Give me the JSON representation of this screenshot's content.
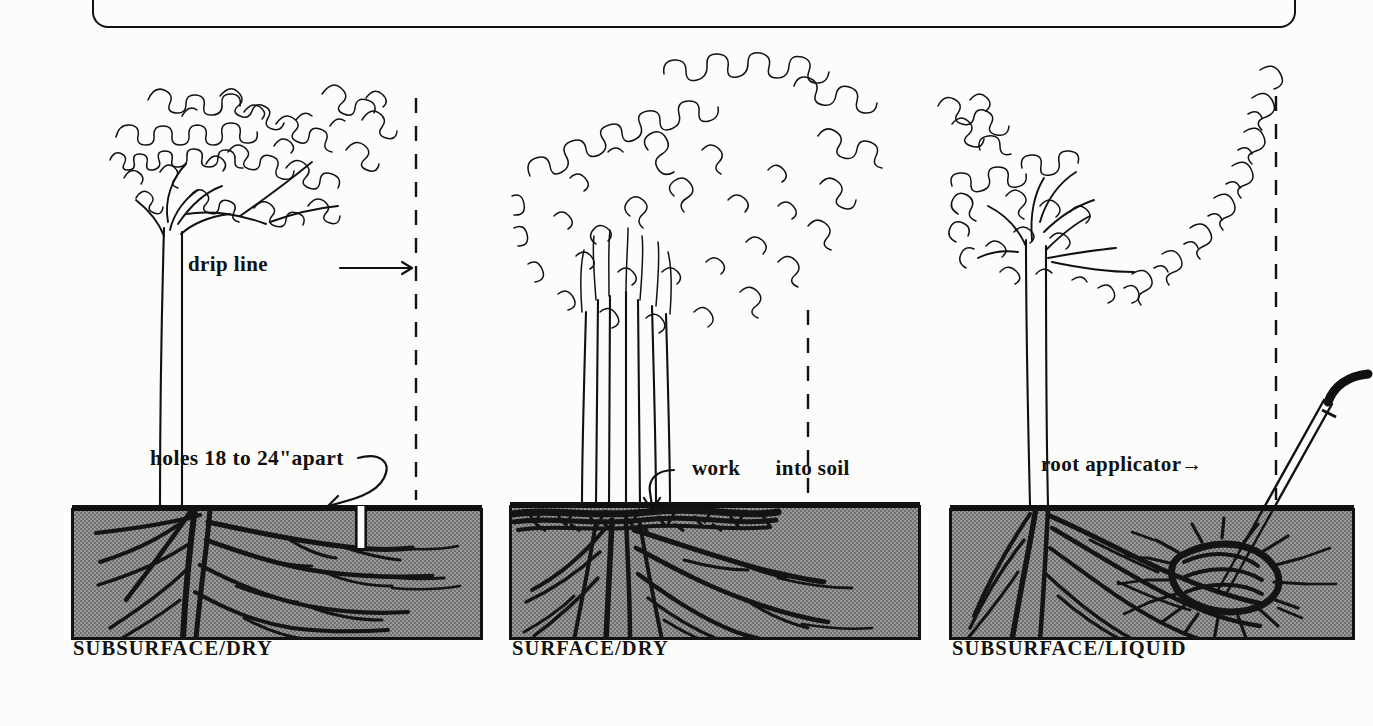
{
  "figure": {
    "ink_color": "#111111",
    "soil_color": "#8e8e8e",
    "background_color": "#fcfcfa"
  },
  "panels": [
    {
      "id": "subsurface-dry",
      "caption": "SUBSURFACE/DRY",
      "annotations": [
        {
          "name": "drip-line",
          "text": "drip line →"
        },
        {
          "name": "holes-spacing",
          "text": "holes 18 to 24\"apart"
        }
      ]
    },
    {
      "id": "surface-dry",
      "caption": "SURFACE/DRY",
      "annotations": [
        {
          "name": "work-into-soil",
          "text": "work into soil"
        }
      ]
    },
    {
      "id": "subsurface-liquid",
      "caption": "SUBSURFACE/LIQUID",
      "annotations": [
        {
          "name": "root-applicator",
          "text": "root applicator→"
        }
      ]
    }
  ],
  "labels": {
    "drip_line": "drip line",
    "drip_line_arrow": "→",
    "holes_spacing": "holes 18 to 24\"apart",
    "work_into_soil_left": "work",
    "work_into_soil_right": "into soil",
    "root_applicator": "root applicator→",
    "caption_1": "SUBSURFACE/DRY",
    "caption_2": "SURFACE/DRY",
    "caption_3": "SUBSURFACE/LIQUID"
  }
}
